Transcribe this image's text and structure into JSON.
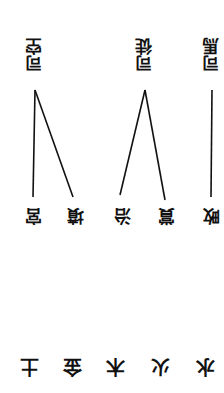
{
  "orientation": "rotated 180 degrees",
  "top_labels": [
    {
      "text": "司空",
      "x": 25,
      "y": 38
    },
    {
      "text": "司徒",
      "x": 135,
      "y": 38
    },
    {
      "text": "司馬",
      "x": 202,
      "y": 38
    }
  ],
  "middle_labels": [
    {
      "text": "宮",
      "x": 22,
      "y": 205
    },
    {
      "text": "墳",
      "x": 64,
      "y": 205
    },
    {
      "text": "治",
      "x": 111,
      "y": 205
    },
    {
      "text": "賞",
      "x": 155,
      "y": 205
    },
    {
      "text": "畋",
      "x": 200,
      "y": 205
    }
  ],
  "bottom_labels": [
    {
      "text": "土",
      "x": 17,
      "y": 355
    },
    {
      "text": "金",
      "x": 60,
      "y": 355
    },
    {
      "text": "木",
      "x": 103,
      "y": 355
    },
    {
      "text": "火",
      "x": 148,
      "y": 355
    },
    {
      "text": "水",
      "x": 193,
      "y": 355
    }
  ],
  "lines": [
    {
      "x1": 35,
      "y1": 90,
      "x2": 33,
      "y2": 197
    },
    {
      "x1": 35,
      "y1": 90,
      "x2": 73,
      "y2": 197
    },
    {
      "x1": 145,
      "y1": 90,
      "x2": 120,
      "y2": 195
    },
    {
      "x1": 145,
      "y1": 90,
      "x2": 165,
      "y2": 200
    },
    {
      "x1": 212,
      "y1": 90,
      "x2": 211,
      "y2": 197
    }
  ]
}
